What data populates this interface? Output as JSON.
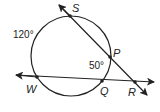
{
  "diagram": {
    "points": {
      "S": "S",
      "P": "P",
      "W": "W",
      "Q": "Q",
      "R": "R"
    },
    "angles": {
      "arc_SW": "120°",
      "arc_PQ": "50°"
    },
    "colors": {
      "stroke": "#222222",
      "background": "#ffffff"
    }
  }
}
